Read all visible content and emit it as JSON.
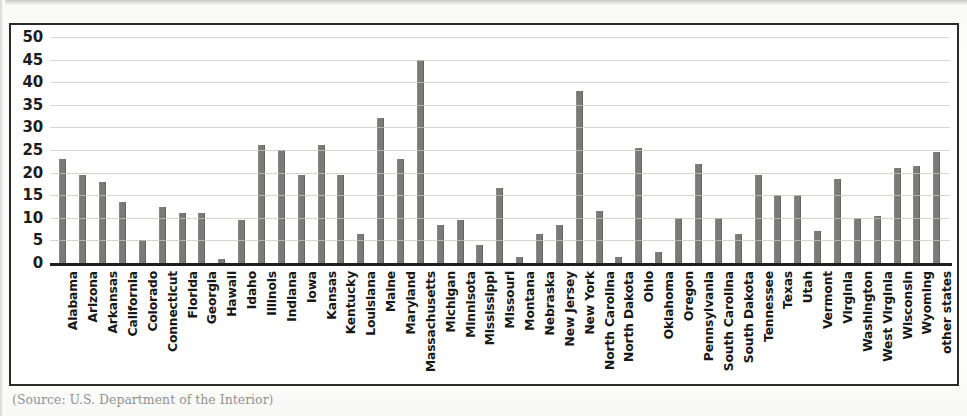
{
  "caption": "(Source: U.S. Department of the Interior)",
  "chart_data": {
    "type": "bar",
    "title": "",
    "subtitle": "",
    "xlabel": "",
    "ylabel": "",
    "ylim": [
      0,
      50
    ],
    "ytick_step": 5,
    "yticks": [
      50,
      45,
      40,
      35,
      30,
      25,
      20,
      15,
      10,
      5,
      0
    ],
    "grid": true,
    "legend": false,
    "legend_position": "none",
    "bar_color": "#7a7a78",
    "axis_color": "#1f1f1f",
    "gridline_color": "#c8c8c2",
    "categories": [
      "Alabama",
      "Arizona",
      "Arkansas",
      "California",
      "Colorado",
      "Connecticut",
      "Florida",
      "Georgia",
      "Hawaii",
      "Idaho",
      "Illinois",
      "Indiana",
      "Iowa",
      "Kansas",
      "Kentucky",
      "Louisiana",
      "Maine",
      "Maryland",
      "Massachusetts",
      "Michigan",
      "Minnisota",
      "Mississippi",
      "Missouri",
      "Montana",
      "Nebraska",
      "New Jersey",
      "New York",
      "North Carolina",
      "North Dakota",
      "Ohio",
      "Oklahoma",
      "Oregon",
      "Pennsylvania",
      "South Carolina",
      "South Dakota",
      "Tennessee",
      "Texas",
      "Utah",
      "Vermont",
      "Virginia",
      "Washington",
      "West Virginia",
      "Wisconsin",
      "Wyoming",
      "other states"
    ],
    "values": [
      23,
      19.5,
      18,
      13.5,
      5,
      12.5,
      11,
      11,
      0.8,
      9.5,
      26,
      25,
      19.5,
      26,
      19.5,
      6.5,
      32,
      23,
      45,
      8.5,
      9.5,
      4,
      16.5,
      1.3,
      6.5,
      8.5,
      38,
      11.5,
      1.3,
      25.5,
      2.5,
      10,
      22,
      10,
      6.5,
      19.5,
      15,
      15,
      7,
      18.5,
      10,
      10.5,
      21,
      21.5,
      24.5
    ]
  }
}
